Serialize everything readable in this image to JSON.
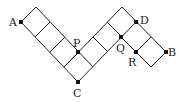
{
  "diagram": {
    "type": "geometry-grid",
    "points": [
      {
        "label": "A",
        "x": 21,
        "y": 22,
        "lx": 9,
        "ly": 26
      },
      {
        "label": "P",
        "x": 78,
        "y": 52,
        "lx": 73,
        "ly": 47
      },
      {
        "label": "C",
        "x": 78,
        "y": 82,
        "lx": 73,
        "ly": 97
      },
      {
        "label": "Q",
        "x": 121,
        "y": 37,
        "lx": 116,
        "ly": 52
      },
      {
        "label": "D",
        "x": 136,
        "y": 22,
        "lx": 140,
        "ly": 24
      },
      {
        "label": "R",
        "x": 136,
        "y": 52,
        "lx": 128,
        "ly": 66
      },
      {
        "label": "B",
        "x": 166,
        "y": 52,
        "lx": 168,
        "ly": 56
      }
    ],
    "line_color": "#222222"
  }
}
